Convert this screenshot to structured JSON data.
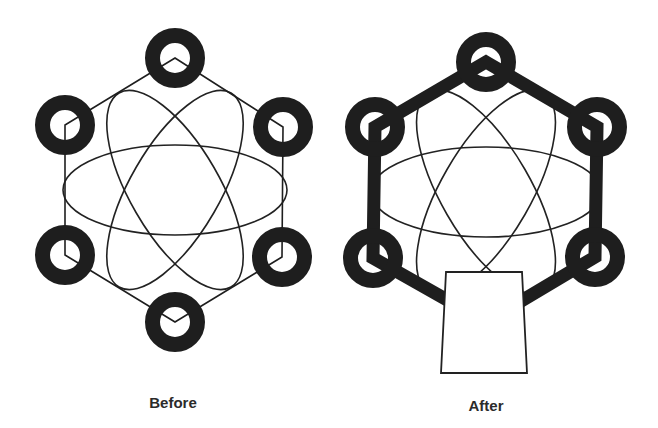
{
  "colors": {
    "stroke": "#222222",
    "ring": "#1e1e1e",
    "background": "#ffffff",
    "label": "#2b2b2b"
  },
  "panels": [
    {
      "id": "before",
      "label": "Before",
      "label_pos": [
        173,
        394
      ],
      "center": [
        175,
        190
      ],
      "ellipse": {
        "rx": 112,
        "ry": 45,
        "angles": [
          0,
          60,
          -60
        ],
        "stroke_width": 1.6
      },
      "hexagon": {
        "vertices": [
          [
            175,
            58
          ],
          [
            283,
            127
          ],
          [
            282,
            257
          ],
          [
            175,
            322
          ],
          [
            65,
            255
          ],
          [
            65,
            125
          ]
        ],
        "stroke_width": 1.6
      },
      "rings": {
        "outer_r": 30,
        "inner_r": 15,
        "centers": [
          [
            175,
            58
          ],
          [
            283,
            127
          ],
          [
            282,
            257
          ],
          [
            175,
            322
          ],
          [
            65,
            255
          ],
          [
            65,
            125
          ]
        ]
      }
    },
    {
      "id": "after",
      "label": "After",
      "label_pos": [
        486,
        397
      ],
      "center": [
        486,
        192
      ],
      "ellipse": {
        "rx": 115,
        "ry": 45,
        "angles": [
          0,
          60,
          -60
        ],
        "stroke_width": 1.6
      },
      "hexagon": {
        "vertices": [
          [
            486,
            62
          ],
          [
            597,
            127
          ],
          [
            595,
            257
          ],
          [
            486,
            322
          ],
          [
            373,
            258
          ],
          [
            375,
            127
          ]
        ],
        "stroke_width": 13
      },
      "rings": {
        "outer_r": 30,
        "inner_r": 15,
        "centers": [
          [
            486,
            62
          ],
          [
            597,
            127
          ],
          [
            595,
            257
          ],
          [
            373,
            258
          ],
          [
            375,
            127
          ]
        ]
      },
      "box": {
        "points": [
          [
            446,
            272
          ],
          [
            522,
            272
          ],
          [
            527,
            373
          ],
          [
            441,
            373
          ]
        ],
        "stroke_width": 1.8
      }
    }
  ]
}
